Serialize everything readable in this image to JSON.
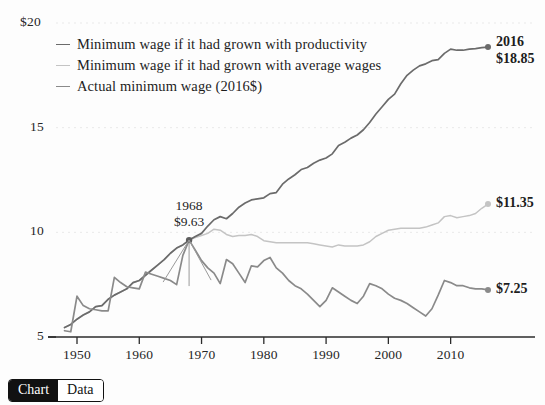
{
  "chart_data": {
    "type": "line",
    "title": "",
    "xlabel": "",
    "ylabel": "",
    "xlim": [
      1947,
      2016
    ],
    "ylim": [
      5,
      20
    ],
    "xticks": [
      1950,
      1960,
      1970,
      1980,
      1990,
      2000,
      2010
    ],
    "yticks": [
      5,
      10,
      15,
      20
    ],
    "ytick_labels": [
      "5",
      "10",
      "15",
      "$20"
    ],
    "grid": "faint-dotted-horizontal",
    "legend_position": "top-left-inside",
    "series": [
      {
        "name": "Minimum wage if it had grown with productivity",
        "color": "#6b6b6b",
        "end_value": 18.85,
        "end_year": 2016,
        "x": [
          1948,
          1949,
          1950,
          1951,
          1952,
          1953,
          1954,
          1955,
          1956,
          1957,
          1958,
          1959,
          1960,
          1961,
          1962,
          1963,
          1964,
          1965,
          1966,
          1967,
          1968,
          1969,
          1970,
          1971,
          1972,
          1973,
          1974,
          1975,
          1976,
          1977,
          1978,
          1979,
          1980,
          1981,
          1982,
          1983,
          1984,
          1985,
          1986,
          1987,
          1988,
          1989,
          1990,
          1991,
          1992,
          1993,
          1994,
          1995,
          1996,
          1997,
          1998,
          1999,
          2000,
          2001,
          2002,
          2003,
          2004,
          2005,
          2006,
          2007,
          2008,
          2009,
          2010,
          2011,
          2012,
          2013,
          2014,
          2015,
          2016
        ],
        "y": [
          5.45,
          5.6,
          5.85,
          6.05,
          6.2,
          6.45,
          6.5,
          6.8,
          7.0,
          7.15,
          7.3,
          7.6,
          7.7,
          7.95,
          8.2,
          8.45,
          8.7,
          9.0,
          9.25,
          9.4,
          9.63,
          9.8,
          9.95,
          10.3,
          10.6,
          10.75,
          10.65,
          10.9,
          11.2,
          11.4,
          11.55,
          11.6,
          11.65,
          11.85,
          11.9,
          12.3,
          12.55,
          12.75,
          13.0,
          13.1,
          13.3,
          13.45,
          13.55,
          13.75,
          14.15,
          14.3,
          14.5,
          14.65,
          14.9,
          15.25,
          15.65,
          16.0,
          16.35,
          16.6,
          17.1,
          17.5,
          17.75,
          17.95,
          18.05,
          18.2,
          18.25,
          18.55,
          18.75,
          18.7,
          18.7,
          18.75,
          18.78,
          18.82,
          18.85
        ]
      },
      {
        "name": "Minimum wage if it had grown with average wages",
        "color": "#c4c4c4",
        "end_value": 11.35,
        "end_year": 2016,
        "x": [
          1948,
          1949,
          1950,
          1951,
          1952,
          1953,
          1954,
          1955,
          1956,
          1957,
          1958,
          1959,
          1960,
          1961,
          1962,
          1963,
          1964,
          1965,
          1966,
          1967,
          1968,
          1969,
          1970,
          1971,
          1972,
          1973,
          1974,
          1975,
          1976,
          1977,
          1978,
          1979,
          1980,
          1981,
          1982,
          1983,
          1984,
          1985,
          1986,
          1987,
          1988,
          1989,
          1990,
          1991,
          1992,
          1993,
          1994,
          1995,
          1996,
          1997,
          1998,
          1999,
          2000,
          2001,
          2002,
          2003,
          2004,
          2005,
          2006,
          2007,
          2008,
          2009,
          2010,
          2011,
          2012,
          2013,
          2014,
          2015,
          2016
        ],
        "y": [
          5.45,
          5.6,
          5.85,
          6.05,
          6.2,
          6.45,
          6.5,
          6.8,
          7.0,
          7.15,
          7.3,
          7.6,
          7.7,
          7.95,
          8.2,
          8.45,
          8.7,
          9.0,
          9.25,
          9.4,
          9.63,
          9.75,
          9.85,
          9.95,
          10.15,
          10.1,
          9.9,
          9.8,
          9.85,
          9.85,
          9.9,
          9.8,
          9.6,
          9.55,
          9.5,
          9.5,
          9.5,
          9.5,
          9.5,
          9.5,
          9.45,
          9.4,
          9.35,
          9.3,
          9.4,
          9.35,
          9.35,
          9.35,
          9.4,
          9.55,
          9.8,
          9.95,
          10.1,
          10.15,
          10.2,
          10.2,
          10.2,
          10.2,
          10.25,
          10.35,
          10.45,
          10.75,
          10.8,
          10.7,
          10.75,
          10.8,
          10.9,
          11.15,
          11.35
        ]
      },
      {
        "name": "Actual minimum wage (2016$)",
        "color": "#8a8a8a",
        "end_value": 7.25,
        "end_year": 2016,
        "x": [
          1948,
          1949,
          1950,
          1951,
          1952,
          1953,
          1954,
          1955,
          1956,
          1957,
          1958,
          1959,
          1960,
          1961,
          1962,
          1963,
          1964,
          1965,
          1966,
          1967,
          1968,
          1969,
          1970,
          1971,
          1972,
          1973,
          1974,
          1975,
          1976,
          1977,
          1978,
          1979,
          1980,
          1981,
          1982,
          1983,
          1984,
          1985,
          1986,
          1987,
          1988,
          1989,
          1990,
          1991,
          1992,
          1993,
          1994,
          1995,
          1996,
          1997,
          1998,
          1999,
          2000,
          2001,
          2002,
          2003,
          2004,
          2005,
          2006,
          2007,
          2008,
          2009,
          2010,
          2011,
          2012,
          2013,
          2014,
          2015,
          2016
        ],
        "y": [
          5.3,
          5.25,
          6.95,
          6.5,
          6.35,
          6.3,
          6.25,
          6.25,
          7.85,
          7.6,
          7.4,
          7.35,
          7.3,
          8.1,
          8.0,
          7.9,
          7.8,
          7.7,
          7.5,
          8.9,
          9.63,
          9.15,
          8.65,
          8.3,
          8.05,
          7.55,
          8.7,
          8.5,
          8.05,
          7.6,
          8.4,
          8.35,
          8.65,
          8.8,
          8.3,
          8.05,
          7.7,
          7.45,
          7.3,
          7.05,
          6.75,
          6.45,
          6.75,
          7.35,
          7.15,
          6.95,
          6.75,
          6.6,
          6.95,
          7.55,
          7.45,
          7.3,
          7.05,
          6.85,
          6.75,
          6.6,
          6.4,
          6.2,
          6.0,
          6.35,
          7.0,
          7.7,
          7.6,
          7.45,
          7.45,
          7.35,
          7.3,
          7.3,
          7.25
        ]
      }
    ],
    "annotations": [
      {
        "name": "peak-1968",
        "year": 1968,
        "value": 9.63,
        "line1": "1968",
        "line2": "$9.63"
      },
      {
        "name": "endpoint-productivity",
        "year": 2016,
        "value": 18.85,
        "line1": "2016",
        "line2": "$18.85"
      },
      {
        "name": "endpoint-average-wages",
        "year": 2016,
        "value": 11.35,
        "line1": "$11.35"
      },
      {
        "name": "endpoint-actual",
        "year": 2016,
        "value": 7.25,
        "line1": "$7.25"
      }
    ]
  },
  "legend": {
    "items": [
      {
        "label": "Minimum wage if it had grown with productivity",
        "color": "#6b6b6b"
      },
      {
        "label": "Minimum wage if it had grown with average wages",
        "color": "#c4c4c4"
      },
      {
        "label": "Actual minimum wage (2016$)",
        "color": "#8a8a8a"
      }
    ]
  },
  "axis": {
    "y_labels": [
      "$20",
      "15",
      "10",
      "5"
    ],
    "x_labels": [
      "1950",
      "1960",
      "1970",
      "1980",
      "1990",
      "2000",
      "2010"
    ]
  },
  "annotations": {
    "peak_year": "1968",
    "peak_value": "$9.63",
    "end_year": "2016",
    "productivity_end": "$18.85",
    "average_wages_end": "$11.35",
    "actual_end": "$7.25"
  },
  "toggle": {
    "chart_label": "Chart",
    "data_label": "Data"
  },
  "colors": {
    "productivity": "#6b6b6b",
    "average_wages": "#c4c4c4",
    "actual": "#8a8a8a",
    "axis": "#2b2b2b",
    "toggle_active_bg": "#111111"
  }
}
